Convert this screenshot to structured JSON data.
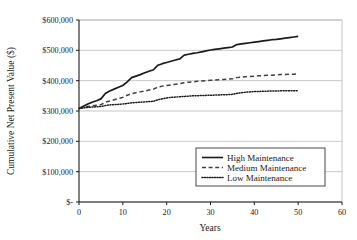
{
  "chart_data": {
    "type": "line",
    "title": "",
    "xlabel": "Years",
    "ylabel": "Cumulative Net Present Value ($)",
    "xlim": [
      0,
      60
    ],
    "ylim": [
      0,
      600000
    ],
    "xticks": [
      0,
      10,
      20,
      30,
      40,
      50,
      60
    ],
    "xtick_labels": [
      "0",
      "10",
      "20",
      "30",
      "40",
      "50",
      "60"
    ],
    "yticks": [
      0,
      100000,
      200000,
      300000,
      400000,
      500000,
      600000
    ],
    "ytick_labels": [
      "$-",
      "$100,000",
      "$200,000",
      "$300,000",
      "$400,000",
      "$500,000",
      "$600,000"
    ],
    "grid": true,
    "grid_axis": "y",
    "legend_position": "lower right",
    "x": [
      0,
      1,
      2,
      3,
      4,
      5,
      6,
      7,
      8,
      9,
      10,
      11,
      12,
      13,
      14,
      15,
      16,
      17,
      18,
      19,
      20,
      21,
      22,
      23,
      24,
      25,
      26,
      27,
      28,
      29,
      30,
      31,
      32,
      33,
      34,
      35,
      36,
      37,
      38,
      39,
      40,
      41,
      42,
      43,
      44,
      45,
      46,
      47,
      48,
      49,
      50
    ],
    "series": [
      {
        "name": "High Maintenance",
        "style": "solid",
        "color": "#1a1a1a",
        "values": [
          308000,
          316000,
          323000,
          329000,
          334000,
          340000,
          358000,
          366000,
          372000,
          378000,
          384000,
          396000,
          410000,
          415000,
          420000,
          426000,
          431000,
          436000,
          451000,
          456000,
          460000,
          464000,
          468000,
          472000,
          484000,
          487000,
          490000,
          492000,
          495000,
          498000,
          501000,
          503000,
          505000,
          507000,
          509000,
          511000,
          519000,
          521000,
          523000,
          525000,
          527000,
          529000,
          531000,
          533000,
          535000,
          536000,
          538000,
          540000,
          542000,
          544000,
          546000
        ]
      },
      {
        "name": "Medium Maintenance",
        "style": "dashed",
        "color": "#404040",
        "values": [
          308000,
          312000,
          315000,
          317000,
          319000,
          321000,
          329000,
          333000,
          337000,
          341000,
          345000,
          352000,
          357000,
          360000,
          363000,
          366000,
          369000,
          372000,
          379000,
          382000,
          384000,
          386000,
          388000,
          390000,
          393000,
          395000,
          396000,
          398000,
          399000,
          400000,
          401000,
          402000,
          403000,
          404000,
          405000,
          406000,
          410000,
          412000,
          413000,
          414000,
          415000,
          416000,
          417000,
          417500,
          418000,
          419000,
          420000,
          420500,
          421000,
          421500,
          422000
        ]
      },
      {
        "name": "Low Maintenance",
        "style": "dotted",
        "color": "#1a1a1a",
        "values": [
          308000,
          310000,
          312000,
          313000,
          314000,
          315000,
          318000,
          320000,
          321000,
          322000,
          323000,
          325000,
          327000,
          328000,
          329000,
          330000,
          331000,
          332000,
          337000,
          340000,
          343000,
          345000,
          346000,
          347000,
          348000,
          349000,
          350000,
          350500,
          351000,
          351500,
          352000,
          352500,
          353000,
          353500,
          354000,
          355000,
          358000,
          360000,
          362000,
          363000,
          364000,
          364500,
          365000,
          365500,
          366000,
          366000,
          366500,
          366500,
          367000,
          367000,
          367000
        ]
      }
    ]
  },
  "legend": {
    "entries": [
      {
        "label": "High Maintenance"
      },
      {
        "label": "Medium Maintenance"
      },
      {
        "label": "Low Maintenance"
      }
    ]
  },
  "colors": {
    "axis": "#1a1a1a",
    "grid": "#b0b0b0",
    "background": "#ffffff",
    "legend_border": "#1a1a1a"
  }
}
